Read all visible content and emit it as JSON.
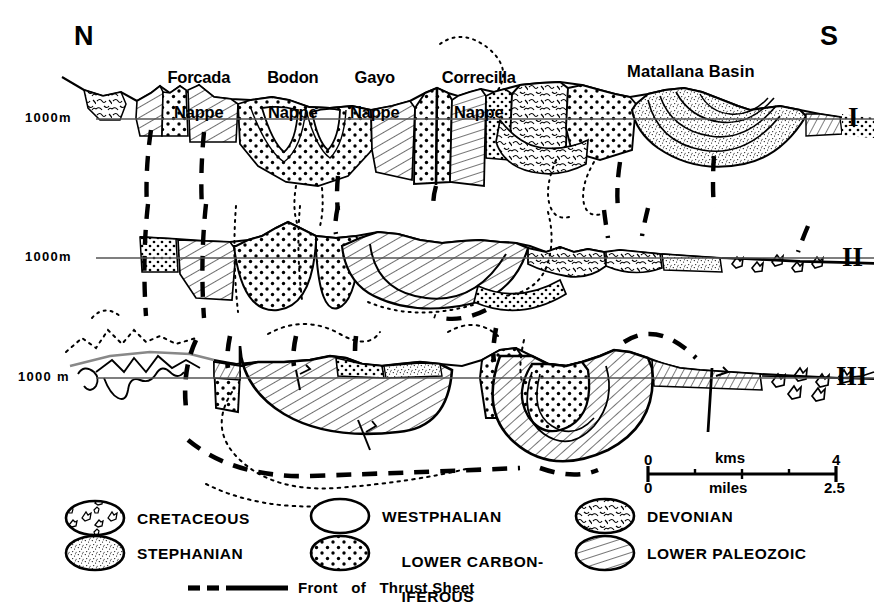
{
  "figure": {
    "kind": "geological-cross-section",
    "orientation_left": "N",
    "orientation_right": "S",
    "datum_label": "1000 m",
    "sections": [
      {
        "id": "I",
        "roman": "I",
        "datum": "1000m"
      },
      {
        "id": "II",
        "roman": "II",
        "datum": "1000m"
      },
      {
        "id": "III",
        "roman": "III",
        "datum": "1000 m"
      }
    ],
    "structure_labels": [
      {
        "name": "Forcada Nappe",
        "line1": "Forcada",
        "line2": "Nappe"
      },
      {
        "name": "Bodon Nappe",
        "line1": "Bodon",
        "line2": "Nappe"
      },
      {
        "name": "Gayo Nappe",
        "line1": "Gayo",
        "line2": "Nappe"
      },
      {
        "name": "Correcilla Nappe",
        "line1": "Correcilla",
        "line2": "Nappe"
      },
      {
        "name": "Matallana Basin",
        "line1": "Matallana Basin",
        "line2": ""
      }
    ]
  },
  "scalebar": {
    "top_unit": "kms",
    "bottom_unit": "miles",
    "top_min": "0",
    "top_max": "4",
    "bottom_min": "0",
    "bottom_max": "2.5"
  },
  "legend": {
    "items": [
      {
        "label": "CRETACEOUS",
        "pattern": "cobbles",
        "column": 1,
        "row": 1
      },
      {
        "label": "STEPHANIAN",
        "pattern": "fine-stipple",
        "column": 1,
        "row": 2
      },
      {
        "label": "WESTPHALIAN",
        "pattern": "blank",
        "column": 2,
        "row": 1
      },
      {
        "label": "LOWER CARBON-",
        "label2": "IFEROUS",
        "pattern": "coarse-dots",
        "column": 2,
        "row": 2
      },
      {
        "label": "DEVONIAN",
        "pattern": "vermicular",
        "column": 3,
        "row": 1
      },
      {
        "label": "LOWER PALEOZOIC",
        "pattern": "hatch",
        "column": 3,
        "row": 2
      }
    ],
    "thrust": {
      "label": "Front   of   Thrust Sheet",
      "style": "dashed-then-solid"
    }
  },
  "colors": {
    "ink": "#000000",
    "paper": "#ffffff",
    "datum_line": "#555555"
  }
}
